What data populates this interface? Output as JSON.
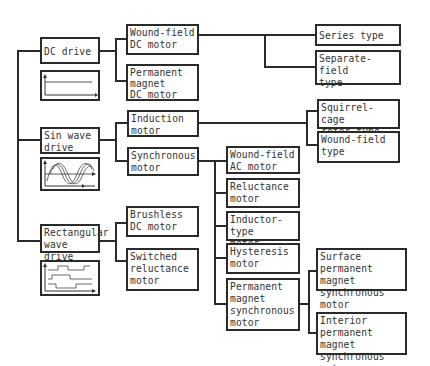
{
  "diagram": {
    "drives": [
      {
        "id": "dc",
        "label": "DC drive",
        "waveform": "dc-step-icon"
      },
      {
        "id": "sin",
        "label": "Sin wave\ndrive",
        "waveform": "sine-wave-icon"
      },
      {
        "id": "rect",
        "label": "Rectangular\nwave drive",
        "waveform": "rectangular-wave-icon"
      }
    ],
    "motors": {
      "wound_field_dc": "Wound-field\nDC motor",
      "pm_dc": "Permanent\nmagnet\nDC motor",
      "induction": "Induction\nmotor",
      "synchronous": "Synchronous\nmotor",
      "brushless_dc": "Brushless\nDC motor",
      "switched_reluctance": "Switched\nreluctance\nmotor"
    },
    "dc_subtypes": {
      "series": "Series type",
      "separate": "Separate-field\ntype"
    },
    "induction_subtypes": {
      "squirrel": "Squirrel-cage\nrotor type",
      "wound": "Wound-field\ntype"
    },
    "synchronous_subtypes": {
      "wound_ac": "Wound-field\nAC motor",
      "reluctance": "Reluctance\nmotor",
      "inductor": "Inductor-type\nmotor",
      "hysteresis": "Hysteresis\nmotor",
      "pm_sync": "Permanent\nmagnet\nsynchronous\nmotor"
    },
    "pm_sync_subtypes": {
      "surface": "Surface permanent\nmagnet synchronous\nmotor",
      "interior": "Interior permanent\nmagnet synchronous\nmotor"
    }
  }
}
